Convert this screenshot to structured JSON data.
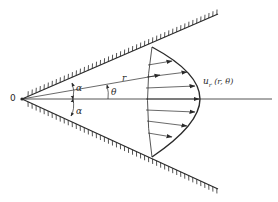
{
  "diagram": {
    "type": "wedge-flow-velocity-profile",
    "labels": {
      "origin": "0",
      "radius": "r",
      "theta": "θ",
      "alpha_upper": "α",
      "alpha_lower": "α",
      "velocity": "u_r (r, θ)",
      "velocity_main": "u",
      "velocity_sub": "r",
      "velocity_args": " (r,  θ)"
    },
    "colors": {
      "line": "#2a2a2a",
      "background": "#ffffff"
    },
    "elements": [
      "upper-wall",
      "lower-wall",
      "symmetry-axis",
      "radius-ray",
      "velocity-profile-arc",
      "reference-arc",
      "velocity-arrows",
      "angle-arcs"
    ]
  }
}
